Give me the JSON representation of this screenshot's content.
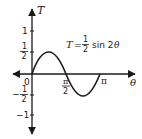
{
  "diagram": {
    "type": "function-graph",
    "equation": {
      "lhs": "T",
      "equals": "=",
      "coef_num": "1",
      "coef_den": "2",
      "func": "sin 2",
      "var": "θ"
    },
    "axes": {
      "x_label": "θ",
      "y_label": "T",
      "origin_label": "0"
    },
    "y_ticks": [
      {
        "label": "1",
        "value": 1
      },
      {
        "label_num": "1",
        "label_den": "2",
        "value": 0.5
      },
      {
        "label_sign": "−",
        "label_num": "1",
        "label_den": "2",
        "value": -0.5
      },
      {
        "label": "−1",
        "value": -1
      }
    ],
    "x_ticks": [
      {
        "label_num": "π",
        "label_den": "2",
        "value": "π/2"
      },
      {
        "label": "π",
        "value": "π"
      }
    ],
    "curve": {
      "function": "T = 1/2 sin 2θ",
      "domain": [
        0,
        "π"
      ],
      "color": "#1a1a1a"
    }
  }
}
